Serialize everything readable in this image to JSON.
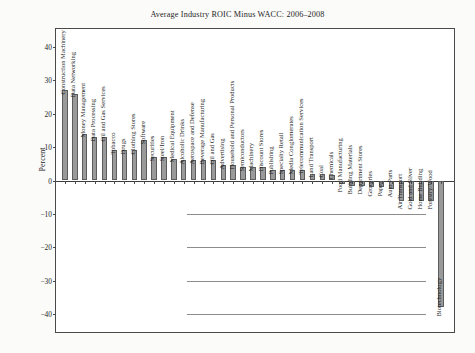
{
  "chart_data": {
    "type": "bar",
    "title": "Average Industry ROIC Minus WACC: 2006–2008",
    "xlabel": "",
    "ylabel": "Percent",
    "ylim": [
      -40,
      40
    ],
    "yticks": [
      40,
      30,
      20,
      10,
      0,
      -10,
      -20,
      -30,
      -40
    ],
    "ytick_labels": [
      "40",
      "30",
      "20",
      "10",
      "0",
      "−10",
      "−20",
      "−30",
      "−40"
    ],
    "grid": true,
    "legend": "none",
    "categories": [
      "Construction Machinery",
      "Data Networking",
      "Money Management",
      "Data Processing",
      "Oil and Gas Services",
      "Tobacco",
      "Drugs",
      "Clothing Stores",
      "Software",
      "Securities",
      "Steel/Iron",
      "Medical Equipment",
      "Alcoholic Drinks",
      "Aerospace and Defense",
      "Beverage Manufacturing",
      "Oil and Gas",
      "Advertising",
      "Household and Personal Products",
      "Semiconductors",
      "Machinery",
      "Discount Stores",
      "Publishing",
      "Specialty Retail",
      "Media Conglomerates",
      "Telecommunication Services",
      "Land Transport",
      "Coal",
      "Chemicals",
      "Food Manufacturing",
      "Building Materials",
      "Department Stores",
      "Groceries",
      "Paper",
      "Auto Parts",
      "Air Transport",
      "Gold and Silver",
      "Home Building",
      "Forestry/Wood",
      "Biotechnology"
    ],
    "values": [
      27,
      26,
      14,
      13,
      13,
      9,
      9,
      9,
      12,
      7,
      7,
      6.5,
      6,
      6,
      6,
      6,
      4.5,
      4.5,
      4,
      4,
      4,
      3,
      3,
      3,
      3,
      2,
      2,
      1.5,
      -1,
      -1.5,
      -1.5,
      -2,
      -2,
      -2.5,
      -6,
      -6,
      -6,
      -6,
      -38
    ]
  },
  "axis": {
    "y_title": "Percent"
  }
}
